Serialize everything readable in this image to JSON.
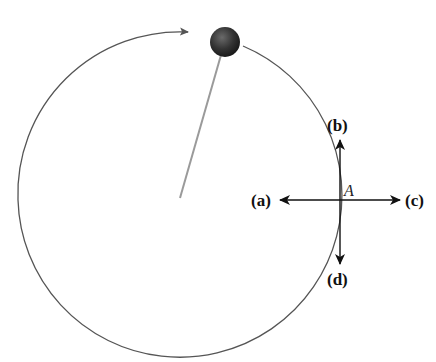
{
  "diagram": {
    "center": {
      "x": 180,
      "y": 200
    },
    "radius": 162,
    "ball": {
      "x": 225,
      "y": 42,
      "r": 14,
      "color": "#333333"
    },
    "motion_direction": "clockwise",
    "point": {
      "label": "A",
      "x": 340,
      "y": 200
    },
    "arrows": [
      {
        "id": "a",
        "label": "(a)",
        "direction": "left"
      },
      {
        "id": "b",
        "label": "(b)",
        "direction": "up"
      },
      {
        "id": "c",
        "label": "(c)",
        "direction": "right"
      },
      {
        "id": "d",
        "label": "(d)",
        "direction": "down"
      }
    ],
    "colors": {
      "path": "#555555",
      "string": "#9a9a9a",
      "arrows": "#111111"
    }
  },
  "labels": {
    "a": "(a)",
    "b": "(b)",
    "c": "(c)",
    "d": "(d)",
    "A": "A"
  }
}
